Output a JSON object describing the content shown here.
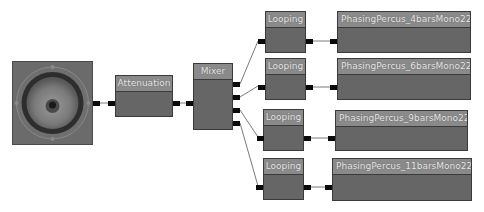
{
  "graph": {
    "output_node": {
      "label": "",
      "icon": "speaker-icon"
    },
    "attenuation": {
      "title": "Attenuation"
    },
    "mixer": {
      "title": "Mixer"
    },
    "looping": [
      {
        "title": "Looping"
      },
      {
        "title": "Looping"
      },
      {
        "title": "Looping"
      },
      {
        "title": "Looping"
      }
    ],
    "waves": [
      {
        "title": "PhasingPercus_4barsMono22k"
      },
      {
        "title": "PhasingPercus_6barsMono22k"
      },
      {
        "title": "PhasingPercus_9barsMono22k"
      },
      {
        "title": "PhasingPercus_11barsMono22k"
      }
    ]
  },
  "colors": {
    "node_body": "#666666",
    "node_title": "#8a8a8a",
    "pin": "#0a0a0a",
    "wire": "#777777",
    "background": "#ffffff"
  }
}
